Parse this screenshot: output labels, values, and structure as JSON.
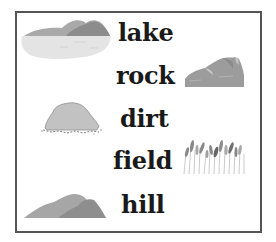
{
  "worksheet": {
    "words": [
      {
        "label": "lake"
      },
      {
        "label": "rock"
      },
      {
        "label": "dirt"
      },
      {
        "label": "field"
      },
      {
        "label": "hill"
      }
    ],
    "pictures": [
      {
        "name": "lake-picture"
      },
      {
        "name": "rock-picture"
      },
      {
        "name": "dirt-picture"
      },
      {
        "name": "field-picture"
      },
      {
        "name": "hill-picture"
      }
    ],
    "colors": {
      "border": "#555555",
      "text": "#1a1a1a",
      "water": "#e3e3e3",
      "light_gray": "#b0b0b0",
      "mid_gray": "#9a9a9a",
      "dark_gray": "#858585"
    }
  }
}
